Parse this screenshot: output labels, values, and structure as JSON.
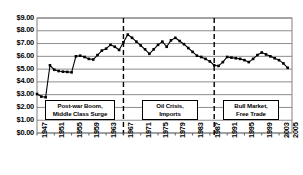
{
  "chart_data": {
    "type": "line",
    "title": "",
    "subtitle": "",
    "xlabel": "",
    "ylabel": "",
    "ylim": [
      0,
      9
    ],
    "ytick_values": [
      0,
      1,
      2,
      3,
      4,
      5,
      6,
      7,
      8,
      9
    ],
    "ytick_labels": [
      "$0.00",
      "$1.00",
      "$2.00",
      "$3.00",
      "$4.00",
      "$5.00",
      "$6.00",
      "$7.00",
      "$8.00",
      "$9.00"
    ],
    "xlim": [
      1947,
      2006
    ],
    "xtick_values": [
      1947,
      1951,
      1955,
      1959,
      1963,
      1967,
      1971,
      1975,
      1979,
      1983,
      1987,
      1991,
      1995,
      1999,
      2003,
      2005
    ],
    "xtick_labels": [
      "1947",
      "1951",
      "1955",
      "1959",
      "1963",
      "1967",
      "1971",
      "1975",
      "1979",
      "1983",
      "1987",
      "1991",
      "1995",
      "1999",
      "2003",
      "2005"
    ],
    "grid": true,
    "grid_axis": "y",
    "legend": false,
    "legend_position": "none",
    "marker": "square",
    "line_color": "#000000",
    "marker_color": "#000000",
    "x": [
      1947,
      1948,
      1949,
      1950,
      1951,
      1952,
      1953,
      1954,
      1955,
      1956,
      1957,
      1958,
      1959,
      1960,
      1961,
      1962,
      1963,
      1964,
      1965,
      1966,
      1967,
      1968,
      1969,
      1970,
      1971,
      1972,
      1973,
      1974,
      1975,
      1976,
      1977,
      1978,
      1979,
      1980,
      1981,
      1982,
      1983,
      1984,
      1985,
      1986,
      1987,
      1988,
      1989,
      1990,
      1991,
      1992,
      1993,
      1994,
      1995,
      1996,
      1997,
      1998,
      1999,
      2000,
      2001,
      2002,
      2003,
      2004,
      2005
    ],
    "values": [
      3.05,
      2.85,
      2.8,
      5.3,
      4.95,
      4.85,
      4.8,
      4.78,
      4.75,
      6.0,
      6.05,
      5.95,
      5.8,
      5.75,
      6.1,
      6.45,
      6.6,
      6.9,
      6.75,
      6.5,
      7.1,
      7.7,
      7.45,
      7.15,
      6.85,
      6.55,
      6.2,
      6.55,
      6.9,
      7.15,
      6.75,
      7.25,
      7.45,
      7.2,
      6.95,
      6.65,
      6.35,
      6.05,
      5.95,
      5.8,
      5.6,
      5.3,
      5.25,
      5.55,
      5.95,
      5.9,
      5.85,
      5.8,
      5.7,
      5.55,
      5.8,
      6.1,
      6.3,
      6.15,
      6.0,
      5.85,
      5.7,
      5.45,
      5.1
    ],
    "annotations": [
      {
        "text_line1": "Post-war Boom,",
        "text_line2": "Middle Class Surge"
      },
      {
        "text_line1": "Oil Crisis,",
        "text_line2": "Imports"
      },
      {
        "text_line1": "Bull Market,",
        "text_line2": "Free Trade"
      }
    ],
    "divider_lines": [
      1967,
      1988
    ],
    "divider_style": "dashed"
  }
}
